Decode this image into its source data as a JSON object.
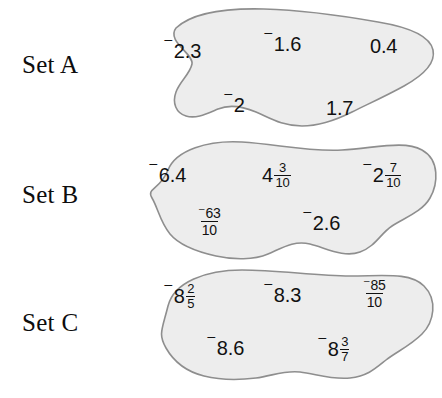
{
  "page": {
    "background_color": "#ffffff",
    "blob_fill_color": "#ededed",
    "blob_stroke_color": "#8e8e8e",
    "text_color": "#111111"
  },
  "sets": [
    {
      "label": "Set A",
      "numbers": [
        {
          "name": "value-neg-2-3",
          "kind": "decimal",
          "negative": true,
          "text": "2.3",
          "display": "⁻2.3"
        },
        {
          "name": "value-neg-1-6",
          "kind": "decimal",
          "negative": true,
          "text": "1.6",
          "display": "⁻1.6"
        },
        {
          "name": "value-0-4",
          "kind": "decimal",
          "negative": false,
          "text": "0.4",
          "display": "0.4"
        },
        {
          "name": "value-neg-2",
          "kind": "decimal",
          "negative": true,
          "text": "2",
          "display": "⁻2"
        },
        {
          "name": "value-1-7",
          "kind": "decimal",
          "negative": false,
          "text": "1.7",
          "display": "1.7"
        }
      ]
    },
    {
      "label": "Set B",
      "numbers": [
        {
          "name": "value-neg-6-4",
          "kind": "decimal",
          "negative": true,
          "text": "6.4",
          "display": "⁻6.4"
        },
        {
          "name": "value-4-and-3-10",
          "kind": "mixed",
          "negative": false,
          "whole": "4",
          "numerator": "3",
          "denominator": "10",
          "display": "4 3/10"
        },
        {
          "name": "value-neg-2-and-7-10",
          "kind": "mixed",
          "negative": true,
          "whole": "2",
          "numerator": "7",
          "denominator": "10",
          "display": "⁻2 7/10"
        },
        {
          "name": "value-neg-63-over-10",
          "kind": "fraction",
          "negative": true,
          "numerator": "63",
          "denominator": "10",
          "display": "⁻63/10"
        },
        {
          "name": "value-neg-2-6",
          "kind": "decimal",
          "negative": true,
          "text": "2.6",
          "display": "⁻2.6"
        }
      ]
    },
    {
      "label": "Set C",
      "numbers": [
        {
          "name": "value-neg-8-and-2-5",
          "kind": "mixed",
          "negative": true,
          "whole": "8",
          "numerator": "2",
          "denominator": "5",
          "display": "⁻8 2/5"
        },
        {
          "name": "value-neg-8-3",
          "kind": "decimal",
          "negative": true,
          "text": "8.3",
          "display": "⁻8.3"
        },
        {
          "name": "value-neg-85-over-10",
          "kind": "fraction",
          "negative": true,
          "numerator": "85",
          "denominator": "10",
          "display": "⁻85/10"
        },
        {
          "name": "value-neg-8-6",
          "kind": "decimal",
          "negative": true,
          "text": "8.6",
          "display": "⁻8.6"
        },
        {
          "name": "value-neg-8-and-3-7",
          "kind": "mixed",
          "negative": true,
          "whole": "8",
          "numerator": "3",
          "denominator": "7",
          "display": "⁻8 3/7"
        }
      ]
    }
  ],
  "symbols": {
    "raised_minus": "⁻"
  }
}
